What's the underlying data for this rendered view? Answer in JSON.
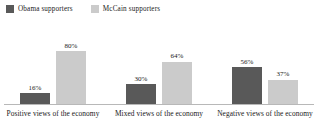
{
  "chart_data": {
    "type": "bar",
    "title": "",
    "subtitle": "",
    "xlabel": "",
    "ylabel": "",
    "ylim": [
      0,
      100
    ],
    "grid": false,
    "legend_position": "top-left",
    "value_label_suffix": "%",
    "categories": [
      "Positive views of the economy",
      "Mixed views of the economy",
      "Negative views of the economy"
    ],
    "series": [
      {
        "name": "Obama supporters",
        "color": "#595959",
        "values": [
          16,
          30,
          56
        ],
        "labels": [
          "16%",
          "30%",
          "56%"
        ]
      },
      {
        "name": "McCain supporters",
        "color": "#cbcbcb",
        "values": [
          80,
          64,
          37
        ],
        "labels": [
          "80%",
          "64%",
          "37%"
        ]
      }
    ]
  },
  "legend": {
    "items": [
      {
        "label": "Obama supporters",
        "swatch_name": "legend-swatch-obama"
      },
      {
        "label": "McCain supporters",
        "swatch_name": "legend-swatch-mccain"
      }
    ]
  },
  "axis": {
    "baseline_color": "#b8b8b8"
  }
}
